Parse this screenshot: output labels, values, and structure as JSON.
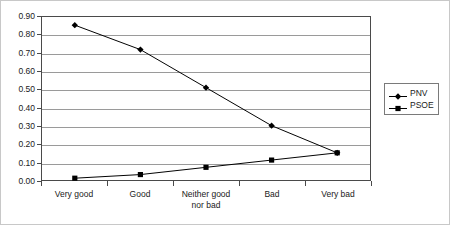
{
  "chart_data": {
    "type": "line",
    "title": "",
    "xlabel": "",
    "ylabel": "",
    "categories": [
      "Very good",
      "Good",
      "Neither good\nnor bad",
      "Bad",
      "Very bad"
    ],
    "ylim": [
      0.0,
      0.9
    ],
    "yticks": [
      "0.00",
      "0.10",
      "0.20",
      "0.30",
      "0.40",
      "0.50",
      "0.60",
      "0.70",
      "0.80",
      "0.90"
    ],
    "ytick_values": [
      0.0,
      0.1,
      0.2,
      0.3,
      0.4,
      0.5,
      0.6,
      0.7,
      0.8,
      0.9
    ],
    "grid": true,
    "legend_position": "right",
    "series": [
      {
        "name": "PNV",
        "marker": "diamond",
        "color": "#000000",
        "values": [
          0.855,
          0.72,
          0.51,
          0.3,
          0.15
        ]
      },
      {
        "name": "PSOE",
        "marker": "square",
        "color": "#000000",
        "values": [
          0.01,
          0.03,
          0.07,
          0.11,
          0.15
        ]
      }
    ]
  },
  "legend": {
    "entries": [
      {
        "label": "PNV"
      },
      {
        "label": "PSOE"
      }
    ]
  }
}
